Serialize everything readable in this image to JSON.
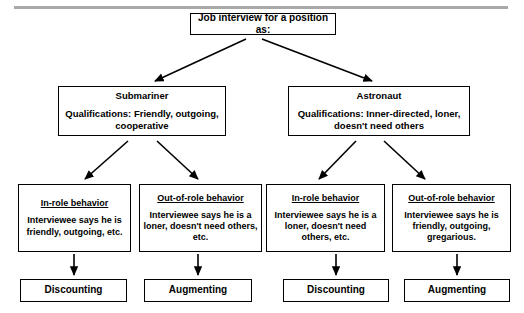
{
  "diagram": {
    "title_box": {
      "label": "Job interview for a position as:"
    },
    "roles": [
      {
        "name": "Submariner",
        "qualifications": "Qualifications: Friendly, outgoing, cooperative"
      },
      {
        "name": "Astronaut",
        "qualifications": "Qualifications: Inner-directed, loner, doesn't need others"
      }
    ],
    "behaviors": [
      {
        "heading": "In-role behavior",
        "description": "Interviewee says he is friendly, outgoing, etc."
      },
      {
        "heading": "Out-of-role behavior",
        "description": "Interviewee says he is a loner, doesn't need others, etc."
      },
      {
        "heading": "In-role behavior",
        "description": "Interviewee says he is a loner, doesn't need others, etc."
      },
      {
        "heading": "Out-of-role behavior",
        "description": "Interviewee says he is friendly, outgoing, gregarious."
      }
    ],
    "outcomes": [
      {
        "label": "Discounting"
      },
      {
        "label": "Augmenting"
      },
      {
        "label": "Discounting"
      },
      {
        "label": "Augmenting"
      }
    ],
    "colors": {
      "line": "#000000",
      "box_border": "#000000",
      "background": "#ffffff",
      "rule": "#a9a9a9"
    }
  }
}
